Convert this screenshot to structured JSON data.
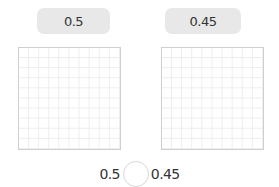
{
  "left": {
    "label": "0.5",
    "grid": {
      "rows": 10,
      "cols": 10,
      "shaded": 0
    }
  },
  "right": {
    "label": "0.45",
    "grid": {
      "rows": 10,
      "cols": 10,
      "shaded": 0
    }
  },
  "comparison": {
    "left_value": "0.5",
    "symbol": "",
    "right_value": "0.45"
  },
  "colors": {
    "label_bg": "#e8e8e8",
    "grid_border": "#cfcfcf",
    "grid_line": "#ececec",
    "text": "#333333"
  }
}
